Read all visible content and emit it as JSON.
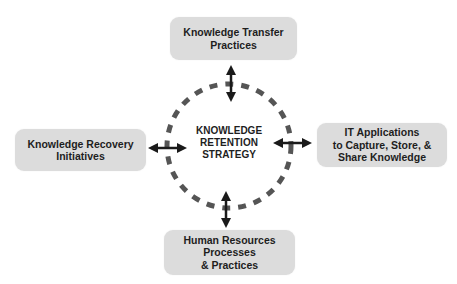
{
  "diagram": {
    "center": {
      "lines": [
        "KNOWLEDGE",
        "RETENTION",
        "STRATEGY"
      ]
    },
    "nodes": {
      "top": {
        "lines": [
          "Knowledge Transfer",
          "Practices"
        ]
      },
      "left": {
        "lines": [
          "Knowledge Recovery",
          "Initiatives"
        ]
      },
      "right": {
        "lines": [
          "IT Applications",
          "to Capture, Store, &",
          "Share Knowledge"
        ]
      },
      "bottom": {
        "lines": [
          "Human Resources",
          "Processes",
          "& Practices"
        ]
      }
    },
    "connectors": [
      "top",
      "left",
      "right",
      "bottom"
    ],
    "colors": {
      "box_fill": "#dcdcdc",
      "circle_dash": "#555555",
      "arrow": "#1a1a1a",
      "text": "#1e1e1e"
    }
  }
}
